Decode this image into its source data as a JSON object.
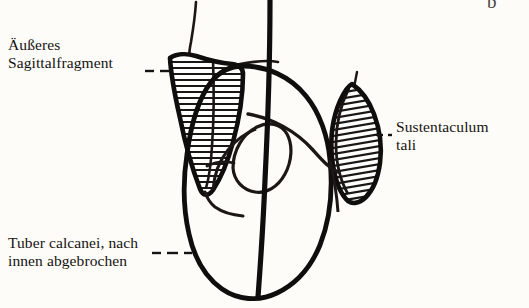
{
  "figure": {
    "kind": "anatomical-line-drawing",
    "language": "de",
    "background_color": "#fdfcf8",
    "ink_color": "#151311"
  },
  "labels": {
    "outer_sagittal_fragment": {
      "line1": "Äußeres",
      "line2": "Sagittalfragment",
      "leader": "dashed-horizontal-right"
    },
    "sustentaculum": {
      "line1": "Sustentaculum",
      "line2": "tali",
      "leader": "dashed-horizontal-left"
    },
    "tuber_calcanei": {
      "line1": "Tuber calcanei, nach",
      "line2": "innen abgebrochen",
      "leader": "dashed-horizontal-right"
    }
  },
  "corner_mark": {
    "text": "b"
  },
  "parts": {
    "fixation_rod": "vertical-rod",
    "left_fragment": "hatched-wedge",
    "right_fragment": "hatched-leaf",
    "bone_body": "rounded-outline",
    "articular_surface": "oval-curve"
  }
}
